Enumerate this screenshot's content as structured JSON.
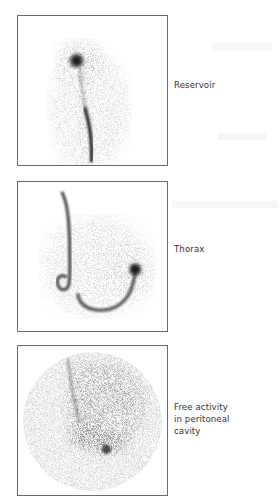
{
  "figure": {
    "panels": [
      {
        "id": "panel-1",
        "label": "Reservoir",
        "description": "Scintigraphic image: hot spot at reservoir with catheter tract extending downward"
      },
      {
        "id": "panel-2",
        "label": "Thorax",
        "description": "Scintigraphic image: looped catheter tract in thorax with focal activity on right"
      },
      {
        "id": "panel-3",
        "label": "Free activity\nin peritoneal\ncavity",
        "description": "Scintigraphic image: diffuse circular activity across peritoneal cavity"
      }
    ]
  },
  "colors": {
    "border": "#6a6a6a",
    "text": "#333333",
    "activity": "#1a1a1a"
  }
}
